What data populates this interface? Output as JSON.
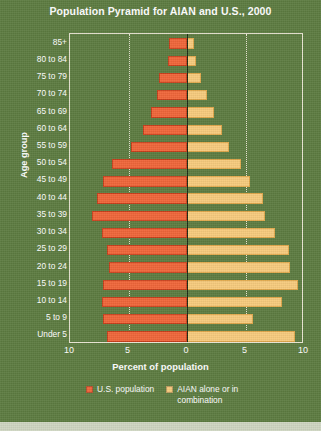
{
  "chart_data": {
    "type": "bar",
    "subtype": "population-pyramid",
    "title": "Population Pyramid for AIAN and U.S., 2000",
    "xlabel": "Percent of population",
    "ylabel": "Age group",
    "grid": true,
    "legend_position": "bottom",
    "xlim": [
      -10,
      10
    ],
    "xticks": [
      {
        "label": "10",
        "value": -10
      },
      {
        "label": "5",
        "value": -5
      },
      {
        "label": "0",
        "value": 0
      },
      {
        "label": "5",
        "value": 5
      },
      {
        "label": "10",
        "value": 10
      }
    ],
    "categories": [
      "85+",
      "80 to 84",
      "75 to 79",
      "70 to 74",
      "65 to 69",
      "60 to 64",
      "55 to 59",
      "50 to 54",
      "45 to 49",
      "40 to 44",
      "35 to 39",
      "30 to 34",
      "25 to 29",
      "20 to 24",
      "15 to 19",
      "10 to 14",
      "5 to 9",
      "Under 5"
    ],
    "series": [
      {
        "name": "U.S. population",
        "side": "left",
        "color": "#f0663a",
        "values": [
          1.5,
          1.6,
          2.4,
          2.6,
          3.1,
          3.8,
          4.8,
          6.4,
          7.2,
          7.7,
          8.1,
          7.3,
          6.8,
          6.7,
          7.2,
          7.3,
          7.2,
          6.8
        ]
      },
      {
        "name": "AIAN alone or in combination",
        "side": "right",
        "color": "#f7cb7d",
        "values": [
          0.6,
          0.8,
          1.2,
          1.7,
          2.3,
          3.0,
          3.6,
          4.6,
          5.4,
          6.5,
          6.7,
          7.5,
          8.7,
          8.8,
          9.5,
          8.1,
          5.6,
          9.2
        ]
      }
    ]
  },
  "legend": {
    "items": [
      {
        "label": "U.S. population",
        "color": "#f0663a"
      },
      {
        "label": "AIAN alone or in combination",
        "color": "#f7cb7d"
      }
    ]
  }
}
